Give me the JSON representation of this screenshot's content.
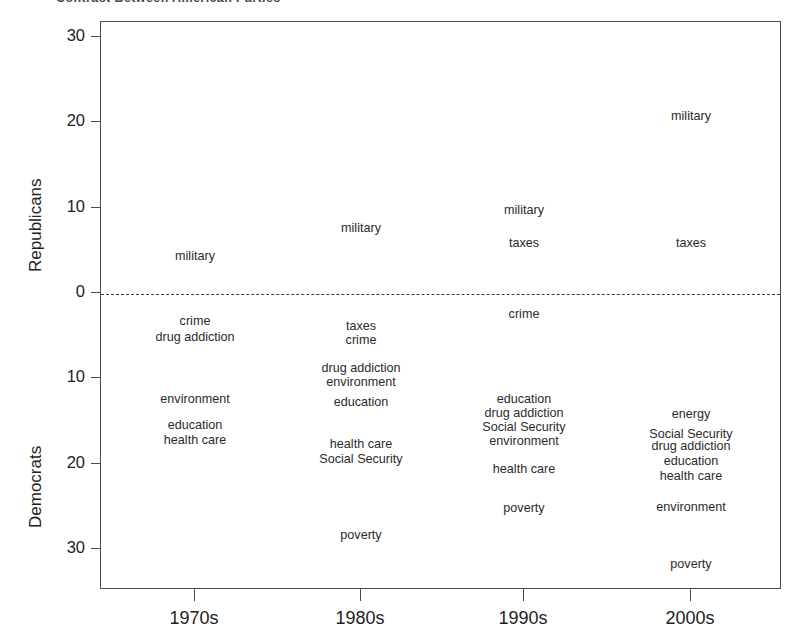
{
  "figure": {
    "title_clipped": "Contrast Between American Parties",
    "background": "#ffffff",
    "frame_color": "#4d4d4d",
    "text_color": "#2b2b2b"
  },
  "axes": {
    "y_upper_label": "Republicans",
    "y_lower_label": "Democrats",
    "y_ticks": [
      {
        "label": "30",
        "value": 30
      },
      {
        "label": "20",
        "value": 20
      },
      {
        "label": "10",
        "value": 10
      },
      {
        "label": "0",
        "value": 0
      },
      {
        "label": "10",
        "value": -10
      },
      {
        "label": "20",
        "value": -20
      },
      {
        "label": "30",
        "value": -30
      }
    ],
    "x_ticks": [
      "1970s",
      "1980s",
      "1990s",
      "2000s"
    ],
    "zero_line_style": "dashed"
  },
  "chart_data": {
    "type": "scatter",
    "title": "Contrast Between American Parties",
    "xlabel": "",
    "ylabel": "Republicans / Democrats",
    "ylim": [
      -33,
      32
    ],
    "grid": false,
    "legend": "none",
    "note": "Text labels plotted at (decade, net-advantage). Positive values = Republican advantage, negative values = Democratic advantage.",
    "categories": [
      "1970s",
      "1980s",
      "1990s",
      "2000s"
    ],
    "points": [
      {
        "x": "1970s",
        "label": "military",
        "y": 4.5
      },
      {
        "x": "1970s",
        "label": "crime",
        "y": -3.2
      },
      {
        "x": "1970s",
        "label": "drug addiction",
        "y": -5.0
      },
      {
        "x": "1970s",
        "label": "environment",
        "y": -12.3
      },
      {
        "x": "1970s",
        "label": "education",
        "y": -15.4
      },
      {
        "x": "1970s",
        "label": "health care",
        "y": -17.1
      },
      {
        "x": "1980s",
        "label": "military",
        "y": 7.7
      },
      {
        "x": "1980s",
        "label": "taxes",
        "y": -3.8
      },
      {
        "x": "1980s",
        "label": "crime",
        "y": -5.4
      },
      {
        "x": "1980s",
        "label": "drug addiction",
        "y": -8.7
      },
      {
        "x": "1980s",
        "label": "environment",
        "y": -10.3
      },
      {
        "x": "1980s",
        "label": "education",
        "y": -12.7
      },
      {
        "x": "1980s",
        "label": "health care",
        "y": -17.6
      },
      {
        "x": "1980s",
        "label": "Social Security",
        "y": -19.4
      },
      {
        "x": "1980s",
        "label": "poverty",
        "y": -28.3
      },
      {
        "x": "1990s",
        "label": "military",
        "y": 9.9
      },
      {
        "x": "1990s",
        "label": "taxes",
        "y": 6.0
      },
      {
        "x": "1990s",
        "label": "crime",
        "y": -2.4
      },
      {
        "x": "1990s",
        "label": "education",
        "y": -12.3
      },
      {
        "x": "1990s",
        "label": "drug addiction",
        "y": -14.0
      },
      {
        "x": "1990s",
        "label": "Social Security",
        "y": -15.6
      },
      {
        "x": "1990s",
        "label": "environment",
        "y": -17.2
      },
      {
        "x": "1990s",
        "label": "health care",
        "y": -20.5
      },
      {
        "x": "1990s",
        "label": "poverty",
        "y": -25.1
      },
      {
        "x": "2000s",
        "label": "military",
        "y": 20.9
      },
      {
        "x": "2000s",
        "label": "taxes",
        "y": 6.0
      },
      {
        "x": "2000s",
        "label": "energy",
        "y": -14.1
      },
      {
        "x": "2000s",
        "label": "Social Security",
        "y": -16.4
      },
      {
        "x": "2000s",
        "label": "drug addiction",
        "y": -17.8
      },
      {
        "x": "2000s",
        "label": "education",
        "y": -19.6
      },
      {
        "x": "2000s",
        "label": "health care",
        "y": -21.3
      },
      {
        "x": "2000s",
        "label": "environment",
        "y": -25.0
      },
      {
        "x": "2000s",
        "label": "poverty",
        "y": -31.6
      }
    ]
  }
}
